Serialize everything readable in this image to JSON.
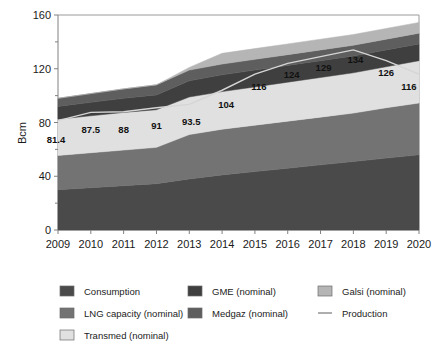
{
  "chart_data": {
    "type": "area",
    "title": "",
    "subtitle": "",
    "xlabel": "",
    "ylabel": "Bcm",
    "categories": [
      "2009",
      "2010",
      "2011",
      "2012",
      "2013",
      "2014",
      "2015",
      "2016",
      "2017",
      "2018",
      "2019",
      "2020"
    ],
    "x": [
      2009,
      2010,
      2011,
      2012,
      2013,
      2014,
      2015,
      2016,
      2017,
      2018,
      2019,
      2020
    ],
    "xlim": [
      2009,
      2020
    ],
    "ylim": [
      0,
      160
    ],
    "yticks": [
      0,
      40,
      80,
      120,
      160
    ],
    "ytick_labels": [
      "0",
      "40",
      "80",
      "120",
      "160"
    ],
    "y_minor_ticks": [
      20,
      60,
      100,
      140
    ],
    "grid": false,
    "stacked": true,
    "legend_position": "bottom",
    "series": [
      {
        "name": "Consumption",
        "type": "area",
        "color": "#4a4a4a",
        "values": [
          30.0,
          31.5,
          33.0,
          34.5,
          38.0,
          41.0,
          43.5,
          46.0,
          48.5,
          51.0,
          53.5,
          56.0
        ]
      },
      {
        "name": "LNG capacity (nominal)",
        "type": "area",
        "color": "#737373",
        "values": [
          25.5,
          26.0,
          26.5,
          27.0,
          33.0,
          34.0,
          34.5,
          35.0,
          35.5,
          36.0,
          37.5,
          38.5
        ]
      },
      {
        "name": "Transmed (nominal)",
        "type": "area",
        "color": "#e0e0e0",
        "values": [
          27.0,
          27.5,
          28.0,
          28.0,
          28.0,
          28.0,
          28.5,
          29.0,
          29.5,
          30.0,
          30.5,
          31.5
        ]
      },
      {
        "name": "GME (nominal)",
        "type": "area",
        "color": "#3f3f3f",
        "values": [
          9.5,
          10.0,
          10.5,
          11.0,
          12.0,
          12.5,
          12.5,
          12.5,
          12.5,
          12.5,
          12.5,
          12.5
        ]
      },
      {
        "name": "Medgaz (nominal)",
        "type": "area",
        "color": "#5e5e5e",
        "values": [
          6.0,
          6.5,
          7.0,
          7.5,
          8.0,
          8.0,
          8.0,
          8.0,
          8.0,
          8.0,
          8.0,
          8.0
        ]
      },
      {
        "name": "Galsi (nominal)",
        "type": "area",
        "color": "#b5b5b5",
        "values": [
          0.0,
          0.0,
          0.0,
          0.0,
          2.0,
          8.0,
          8.0,
          8.0,
          8.0,
          8.0,
          8.0,
          8.0
        ]
      },
      {
        "name": "Production",
        "type": "line",
        "color": "#d5d5d5",
        "values": [
          81.4,
          87.5,
          88,
          91,
          93.5,
          104,
          116,
          124,
          129,
          134,
          126,
          116
        ],
        "labels": [
          "81.4",
          "87.5",
          "88",
          "91",
          "93.5",
          "104",
          "116",
          "124",
          "129",
          "134",
          "126",
          "116"
        ]
      }
    ]
  },
  "axis": {
    "y_title": "Bcm"
  },
  "legend": {
    "items": [
      {
        "label": "Consumption",
        "color": "#4a4a4a",
        "marker": "swatch"
      },
      {
        "label": "GME (nominal)",
        "color": "#3f3f3f",
        "marker": "swatch"
      },
      {
        "label": "Galsi (nominal)",
        "color": "#b5b5b5",
        "marker": "swatch"
      },
      {
        "label": "LNG capacity (nominal)",
        "color": "#737373",
        "marker": "swatch"
      },
      {
        "label": "Medgaz (nominal)",
        "color": "#5e5e5e",
        "marker": "swatch"
      },
      {
        "label": "Production",
        "color": "#9a9a9a",
        "marker": "line"
      },
      {
        "label": "Transmed (nominal)",
        "color": "#e0e0e0",
        "marker": "swatch"
      }
    ]
  }
}
